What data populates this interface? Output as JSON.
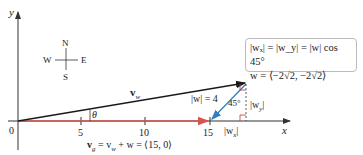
{
  "diagram": {
    "axes": {
      "x_label": "x",
      "y_label": "y",
      "origin_label": "0",
      "x_ticks": [
        "5",
        "10",
        "15"
      ]
    },
    "compass": {
      "north": "N",
      "south": "S",
      "east": "E",
      "west": "W"
    },
    "vectors": {
      "vw_label": "v",
      "vw_sub": "w",
      "w_magnitude_label": "|w| = 4",
      "angle_theta": "θ",
      "angle_45": "45°",
      "wx_label": "|w",
      "wx_sub": "x",
      "wy_label": "|w",
      "wy_sub": "y",
      "vg_equation_prefix": "v",
      "vg_sub": "g",
      "vg_equation_rest": " = v",
      "vg_sub2": "w",
      "vg_equation_tail": " + w = ⟨15, 0⟩"
    },
    "info_box": {
      "line1": "|wₓ| = |w_y| = |w| cos 45°",
      "line2": "w = ⟨−2√2, −2√2⟩"
    },
    "colors": {
      "vw": "#1a1a1a",
      "vg": "#d9534f",
      "w": "#2f7fc4",
      "axis": "#333333",
      "right_angle": "#c0392b"
    }
  }
}
